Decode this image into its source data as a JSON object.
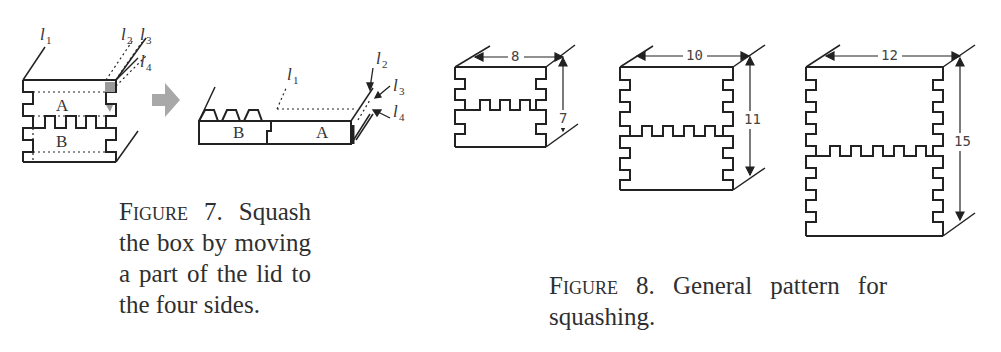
{
  "figure7": {
    "caption_label": "Figure 7.",
    "caption_text": " Squash the box by moving a part of the lid to the four sides.",
    "box_labels": {
      "top": "A",
      "bottom": "B"
    },
    "line_labels": [
      "l",
      "l",
      "l",
      "l"
    ],
    "line_subscripts": [
      "1",
      "2",
      "3",
      "4"
    ],
    "squashed_labels": {
      "left": "B",
      "right": "A"
    },
    "arrow_color": "#a8a8a8"
  },
  "figure8": {
    "caption_label": "Figure 8.",
    "caption_text": " General pattern for squashing.",
    "boxes": [
      {
        "width_label": "8",
        "height_label": "7"
      },
      {
        "width_label": "10",
        "height_label": "11"
      },
      {
        "width_label": "12",
        "height_label": "15"
      }
    ]
  }
}
